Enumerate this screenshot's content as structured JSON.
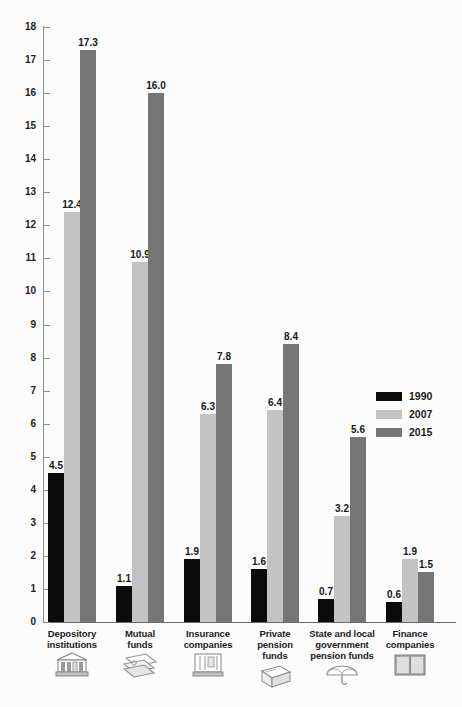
{
  "chart_data": {
    "type": "bar",
    "title": "",
    "subtitle": "",
    "xlabel": "",
    "ylabel": "",
    "ylim": [
      0,
      18
    ],
    "ytick_step": 1,
    "grid": false,
    "legend_position": "right-middle",
    "categories": [
      "Depository institutions",
      "Mutual funds",
      "Insurance companies",
      "Private pension funds",
      "State and local government pension funds",
      "Finance companies"
    ],
    "category_lines": [
      [
        "Depository",
        "institutions"
      ],
      [
        "Mutual",
        "funds"
      ],
      [
        "Insurance",
        "companies"
      ],
      [
        "Private",
        "pension",
        "funds"
      ],
      [
        "State and local",
        "government",
        "pension funds"
      ],
      [
        "Finance",
        "companies"
      ]
    ],
    "category_icons": [
      "bank-building-icon",
      "open-folder-icon",
      "document-stack-icon",
      "ledger-book-icon",
      "umbrella-icon",
      "open-book-icon"
    ],
    "series": [
      {
        "name": "1990",
        "color": "#0b0b0b",
        "values": [
          4.5,
          1.1,
          1.9,
          1.6,
          0.7,
          0.6
        ]
      },
      {
        "name": "2007",
        "color": "#c3c3c3",
        "values": [
          12.4,
          10.9,
          6.3,
          6.4,
          3.2,
          1.9
        ]
      },
      {
        "name": "2015",
        "color": "#767676",
        "values": [
          17.3,
          16.0,
          7.8,
          8.4,
          5.6,
          1.5
        ]
      }
    ],
    "value_labels": [
      [
        "4.5",
        "12.4",
        "17.3"
      ],
      [
        "1.1",
        "10.9",
        "16.0"
      ],
      [
        "1.9",
        "6.3",
        "7.8"
      ],
      [
        "1.6",
        "6.4",
        "8.4"
      ],
      [
        "0.7",
        "3.2",
        "5.6"
      ],
      [
        "0.6",
        "1.9",
        "1.5"
      ]
    ],
    "ytick_labels": [
      "0",
      "1",
      "2",
      "3",
      "4",
      "5",
      "6",
      "7",
      "8",
      "9",
      "10",
      "11",
      "12",
      "13",
      "14",
      "15",
      "16",
      "17",
      "18"
    ],
    "legend": [
      {
        "label": "1990",
        "color": "#0b0b0b"
      },
      {
        "label": "2007",
        "color": "#c3c3c3"
      },
      {
        "label": "2015",
        "color": "#767676"
      }
    ]
  }
}
